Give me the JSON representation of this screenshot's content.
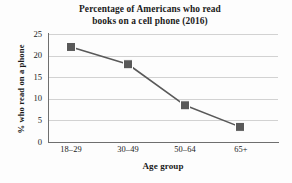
{
  "chart_data": {
    "type": "line",
    "title": "Percentage of Americans who read books on a cell phone (2016)",
    "title_line1": "Percentage of Americans who read",
    "title_line2": "books on a cell phone (2016)",
    "xlabel": "Age group",
    "ylabel": "% who read on a phone",
    "categories": [
      "18–29",
      "30–49",
      "50–64",
      "65+"
    ],
    "values": [
      22,
      18,
      8.5,
      3.5
    ],
    "series": [
      {
        "name": "% who read on a phone",
        "values": [
          22,
          18,
          8.5,
          3.5
        ]
      }
    ],
    "ylim": [
      0,
      25
    ],
    "yticks": [
      0,
      5,
      10,
      15,
      20,
      25
    ],
    "ytick_labels": [
      "0",
      "5",
      "10",
      "15",
      "20",
      "25"
    ],
    "grid": "horizontal",
    "legend": "none",
    "marker": "square",
    "colors": {
      "line": "#595959",
      "marker": "#595959",
      "grid": "#d2d2d2",
      "axis": "#6f6f6f",
      "text": "#1a1a1a",
      "background": "#fdfdfd"
    }
  }
}
